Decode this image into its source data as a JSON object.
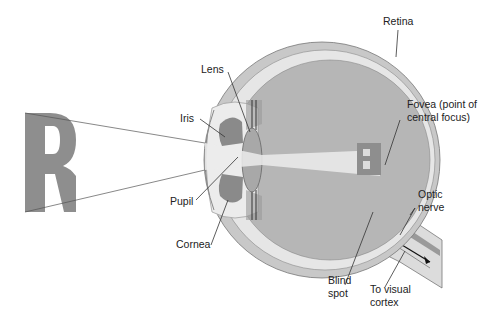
{
  "diagram": {
    "labels": {
      "retina": "Retina",
      "lens": "Lens",
      "iris": "Iris",
      "pupil": "Pupil",
      "cornea": "Cornea",
      "fovea_line1": "Fovea (point of",
      "fovea_line2": "central focus)",
      "optic_line1": "Optic",
      "optic_line2": "nerve",
      "blind_line1": "Blind",
      "blind_line2": "spot",
      "cortex_line1": "To visual",
      "cortex_line2": "cortex"
    },
    "object_letter": "R",
    "image_letter": "R",
    "colors": {
      "sclera": "#c8c8c8",
      "choroid": "#e4e4e4",
      "vitreous": "#b4b4b4",
      "iris": "#8a8a8a",
      "letter": "#8e8e8e",
      "light_beam": "#ececec"
    }
  }
}
